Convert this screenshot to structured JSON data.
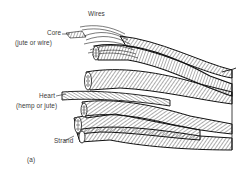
{
  "figure": {
    "panel_label": "(a)",
    "labels": [
      {
        "id": "wires",
        "text": "Wires"
      },
      {
        "id": "core",
        "text": "Core"
      },
      {
        "id": "core_note",
        "text": "(jute or wire)"
      },
      {
        "id": "heart",
        "text": "Heart"
      },
      {
        "id": "heart_note",
        "text": "(hemp or jute)"
      },
      {
        "id": "strand",
        "text": "Strand"
      }
    ]
  },
  "colors": {
    "background": "#ffffff",
    "ink": "#111111",
    "label_text": "#3a3a3a"
  }
}
